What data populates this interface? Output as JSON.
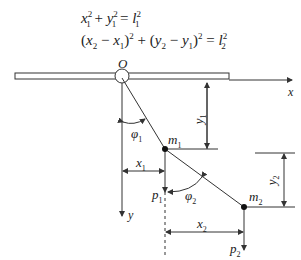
{
  "equations": {
    "eq1": {
      "x": "x",
      "y": "y",
      "l": "l",
      "sub": "1",
      "sup": "2",
      "plus": " + ",
      "eq": " = "
    },
    "eq2": {
      "lp": "(",
      "rp": ")",
      "x": "x",
      "y": "y",
      "l": "l",
      "minus": " − ",
      "plus": " + ",
      "eq": " = ",
      "s1": "1",
      "s2": "2",
      "sup": "2"
    }
  },
  "diagram": {
    "origin_label": "O",
    "x_axis_label": "x",
    "y_axis_label": "y",
    "phi1": {
      "sym": "φ",
      "sub": "1"
    },
    "phi2": {
      "sym": "φ",
      "sub": "2"
    },
    "m1": {
      "sym": "m",
      "sub": "1"
    },
    "m2": {
      "sym": "m",
      "sub": "2"
    },
    "x1": {
      "sym": "x",
      "sub": "1"
    },
    "x2": {
      "sym": "x",
      "sub": "2"
    },
    "y1": {
      "sym": "y",
      "sub": "1"
    },
    "y2": {
      "sym": "y",
      "sub": "2"
    },
    "p1": {
      "sym": "p",
      "sub": "1"
    },
    "p2": {
      "sym": "p",
      "sub": "2"
    },
    "line_color": "#333333"
  }
}
